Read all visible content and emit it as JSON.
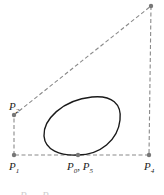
{
  "figure": {
    "control_points": [
      {
        "id": "P0",
        "label_main": "P",
        "label_sub": "0"
      },
      {
        "id": "P1",
        "label_main": "P",
        "label_sub": "1"
      },
      {
        "id": "P2",
        "label_main": "P",
        "label_sub": "2"
      },
      {
        "id": "P3",
        "label_main": "P",
        "label_sub": "3"
      },
      {
        "id": "P4",
        "label_main": "P",
        "label_sub": "4"
      },
      {
        "id": "P5",
        "label_main": "P",
        "label_sub": "5"
      }
    ],
    "labels": {
      "p1": {
        "main": "P",
        "sub": "1"
      },
      "p2": {
        "main": "P",
        "sub": "2"
      },
      "p4": {
        "main": "P",
        "sub": "4"
      },
      "p0p5": {
        "main0": "P",
        "sub0": "0",
        "sep": ", ",
        "main5": "P",
        "sub5": "5"
      }
    },
    "colors": {
      "polygon": "#8a8a8a",
      "curve": "#1a1a1a",
      "points": "#777777"
    },
    "bottom_fragment": {
      "left": "P",
      "left2": "P"
    }
  }
}
